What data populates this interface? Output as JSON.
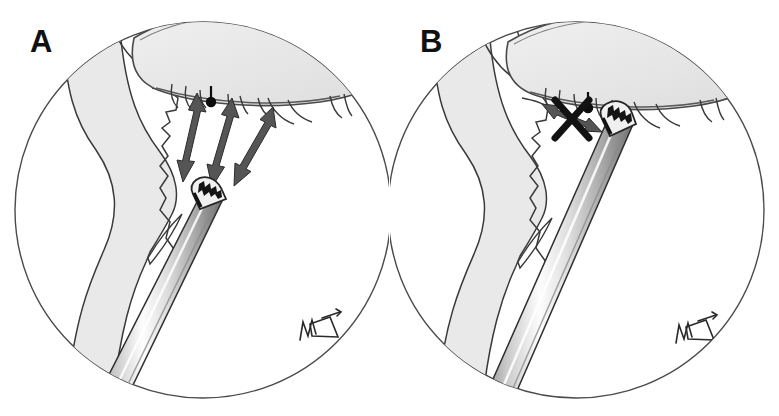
{
  "figure": {
    "kind": "medical-illustration",
    "background_color": "#ffffff",
    "width": 779,
    "height": 416
  },
  "panels": [
    {
      "id": "a",
      "label": "A",
      "view": "endoscopic-circular-view",
      "elements": {
        "mucosa_shading_color": "#e9e9e9",
        "outline_color": "#3a3a3a",
        "arrow_color": "#555555",
        "arrow_count": 3,
        "arrow_style": "double-headed",
        "arrow_meaning": "instrument-free-motion",
        "instrument": "serrated-grasping-forceps",
        "instrument_shaft_color": "#d9d9d9",
        "instrument_jaw_color": "#1a1a1a",
        "marker_dot_color": "#0d0d0d",
        "signature": "artist-monogram"
      }
    },
    {
      "id": "b",
      "label": "B",
      "view": "endoscopic-circular-view",
      "elements": {
        "mucosa_shading_color": "#e9e9e9",
        "outline_color": "#3a3a3a",
        "arrow_color": "#555555",
        "arrow_count": 1,
        "arrow_style": "double-headed",
        "arrow_meaning": "blocked-motion",
        "blocked_marker": "X",
        "blocked_marker_color": "#111111",
        "instrument": "serrated-grasping-forceps",
        "instrument_shaft_color": "#d9d9d9",
        "instrument_jaw_color": "#1a1a1a",
        "marker_dot_color": "#0d0d0d",
        "signature": "artist-monogram"
      }
    }
  ]
}
